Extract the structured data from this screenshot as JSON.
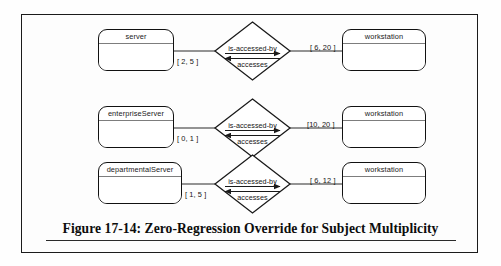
{
  "figure": {
    "caption": "Figure 17-14: Zero-Regression Override for Subject Multiplicity",
    "accent_color": "#111111",
    "divider_color": "#7d7d7d",
    "background_color": "#fdfdfd"
  },
  "relationships": [
    {
      "subject_entity": "server",
      "subject_multiplicity": "[ 2, 5 ]",
      "forward_role": "is-accessed-by",
      "reverse_role": "accesses",
      "object_multiplicity": "[ 6, 20 ]",
      "object_entity": "workstation"
    },
    {
      "subject_entity": "enterpriseServer",
      "subject_multiplicity": "[ 0, 1 ]",
      "forward_role": "is-accessed-by",
      "reverse_role": "accesses",
      "object_multiplicity": "[10, 20 ]",
      "object_entity": "workstation"
    },
    {
      "subject_entity": "departmentalServer",
      "subject_multiplicity": "[ 1, 5 ]",
      "forward_role": "is-accessed-by",
      "reverse_role": "accesses",
      "object_multiplicity": "[ 6, 12 ]",
      "object_entity": "workstation"
    }
  ]
}
